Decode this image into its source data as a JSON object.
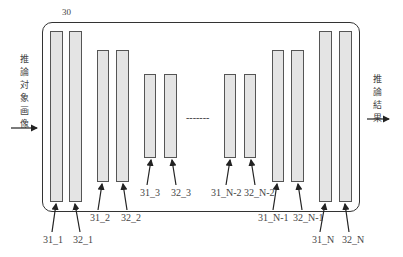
{
  "diagram": {
    "block_label": "30",
    "input_label": [
      "推",
      "論",
      "対",
      "象",
      "画",
      "像"
    ],
    "output_label": [
      "推",
      "論",
      "結",
      "果"
    ],
    "ellipsis": "-------",
    "layers": [
      {
        "id": "31_1",
        "label": "31_1"
      },
      {
        "id": "32_1",
        "label": "32_1"
      },
      {
        "id": "31_2",
        "label": "31_2"
      },
      {
        "id": "32_2",
        "label": "32_2"
      },
      {
        "id": "31_3",
        "label": "31_3"
      },
      {
        "id": "32_3",
        "label": "32_3"
      },
      {
        "id": "31_N-2",
        "label": "31_N-2"
      },
      {
        "id": "32_N-2",
        "label": "32_N-2"
      },
      {
        "id": "31_N-1",
        "label": "31_N-1"
      },
      {
        "id": "32_N-1",
        "label": "32_N-1"
      },
      {
        "id": "31_N",
        "label": "31_N"
      },
      {
        "id": "32_N",
        "label": "32_N"
      }
    ],
    "colors": {
      "bar_fill": "#e4e4e4",
      "stroke": "#333333"
    }
  }
}
